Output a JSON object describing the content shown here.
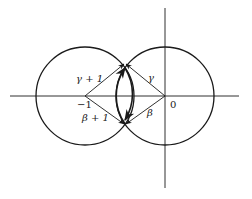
{
  "diagram": {
    "stroke_color": "#1a1a1a",
    "background": "#ffffff",
    "points": {
      "minus_one": {
        "label": "−1",
        "x": 85,
        "y": 96
      },
      "origin": {
        "label": "0",
        "x": 165,
        "y": 96
      },
      "top_intersection": {
        "x": 125,
        "y": 63
      },
      "bottom_intersection": {
        "x": 125,
        "y": 125
      }
    },
    "circles": [
      {
        "name": "left-circle",
        "cx": 85,
        "cy": 96,
        "r": 49
      },
      {
        "name": "right-circle",
        "cx": 165,
        "cy": 96,
        "r": 49
      }
    ],
    "vectors": [
      {
        "name": "gamma-plus-one",
        "label": "γ + 1",
        "from": "minus_one",
        "to": "top_intersection"
      },
      {
        "name": "gamma",
        "label": "γ",
        "from": "origin",
        "to": "top_intersection"
      },
      {
        "name": "beta-plus-one",
        "label": "β + 1",
        "from": "minus_one",
        "to": "bottom_intersection"
      },
      {
        "name": "beta",
        "label": "β",
        "from": "origin",
        "to": "bottom_intersection"
      }
    ],
    "arcs": [
      {
        "name": "lens-left-arc",
        "direction": "bidirectional",
        "note": "inner arc of right circle with arrowheads at both intersections"
      },
      {
        "name": "lens-right-arc",
        "direction": "bidirectional",
        "note": "inner arc of left circle with arrowheads at both intersections"
      }
    ],
    "labels": {
      "minus_one": "−1",
      "zero": "0",
      "gamma_plus_one": "γ + 1",
      "gamma": "γ",
      "beta_plus_one": "β + 1",
      "beta": "β"
    }
  }
}
